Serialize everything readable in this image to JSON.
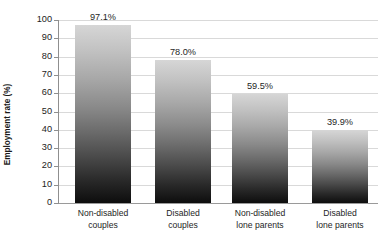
{
  "chart_data": {
    "type": "bar",
    "title": "",
    "xlabel": "",
    "ylabel": "Employment rate (%)",
    "ylim": [
      0,
      100
    ],
    "grid": true,
    "legend": "none",
    "y_ticks": [
      0,
      10,
      20,
      30,
      40,
      50,
      60,
      70,
      80,
      90,
      100
    ],
    "categories": [
      "Non-disabled couples",
      "Disabled couples",
      "Non-disabled lone parents",
      "Disabled lone parents"
    ],
    "category_lines": [
      [
        "Non-disabled",
        "couples"
      ],
      [
        "Disabled",
        "couples"
      ],
      [
        "Non-disabled",
        "lone parents"
      ],
      [
        "Disabled",
        "lone parents"
      ]
    ],
    "values": [
      97.1,
      78.0,
      59.5,
      39.9
    ],
    "data_labels": [
      "97.1%",
      "78.0%",
      "59.5%",
      "39.9%"
    ]
  },
  "colors": {
    "background": "#ffffff",
    "bar_top": "#d6d6d6",
    "bar_bottom": "#0d0d0d",
    "gridline": "#d9d9d9",
    "axis": "#8f8f8f",
    "text": "#1e1e1e"
  }
}
